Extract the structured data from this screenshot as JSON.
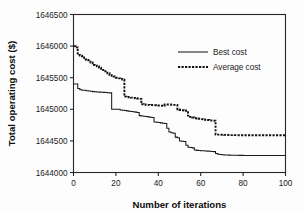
{
  "chart_data": {
    "type": "line",
    "title": "",
    "xlabel": "Number of iterations",
    "ylabel": "Total operating cost ($)",
    "xlim": [
      0,
      100
    ],
    "ylim": [
      1644000,
      1646500
    ],
    "xticks": [
      0,
      20,
      40,
      60,
      80,
      100
    ],
    "yticks": [
      1644000,
      1644500,
      1645000,
      1645500,
      1646000,
      1646500
    ],
    "xtick_labels": [
      "0",
      "20",
      "40",
      "60",
      "80",
      "100"
    ],
    "ytick_labels": [
      "1644000",
      "1644500",
      "1645000",
      "1645500",
      "1646000",
      "1646500"
    ],
    "grid": false,
    "legend_position": "upper right",
    "series": [
      {
        "name": "Best cost",
        "style": "solid",
        "x": [
          0,
          1,
          2,
          3,
          4,
          5,
          6,
          7,
          8,
          9,
          10,
          11,
          12,
          13,
          14,
          15,
          16,
          17,
          18,
          19,
          20,
          21,
          22,
          23,
          24,
          25,
          26,
          27,
          28,
          29,
          30,
          31,
          32,
          33,
          34,
          35,
          36,
          37,
          38,
          39,
          40,
          41,
          42,
          43,
          44,
          45,
          46,
          47,
          48,
          49,
          50,
          51,
          52,
          53,
          54,
          55,
          56,
          57,
          58,
          59,
          60,
          61,
          62,
          63,
          64,
          65,
          66,
          67,
          68,
          69,
          70,
          71,
          72,
          73,
          74,
          75,
          76,
          77,
          78,
          79,
          80,
          81,
          82,
          83,
          84,
          85,
          86,
          87,
          88,
          89,
          90,
          91,
          92,
          93,
          94,
          95,
          96,
          97,
          98,
          99,
          100
        ],
        "y": [
          1645400,
          1645400,
          1645330,
          1645310,
          1645300,
          1645300,
          1645295,
          1645290,
          1645285,
          1645280,
          1645278,
          1645275,
          1645272,
          1645270,
          1645268,
          1645265,
          1645262,
          1645260,
          1645000,
          1645000,
          1645000,
          1645000,
          1644990,
          1644985,
          1644980,
          1644975,
          1644970,
          1644965,
          1644960,
          1644955,
          1644950,
          1644900,
          1644895,
          1644890,
          1644885,
          1644880,
          1644875,
          1644870,
          1644800,
          1644795,
          1644790,
          1644785,
          1644780,
          1644775,
          1644700,
          1644640,
          1644630,
          1644620,
          1644560,
          1644550,
          1644500,
          1644495,
          1644490,
          1644430,
          1644400,
          1644395,
          1644390,
          1644355,
          1644350,
          1644348,
          1644345,
          1644343,
          1644340,
          1644338,
          1644335,
          1644333,
          1644330,
          1644300,
          1644290,
          1644285,
          1644280,
          1644278,
          1644276,
          1644275,
          1644274,
          1644273,
          1644272,
          1644272,
          1644271,
          1644271,
          1644270,
          1644270,
          1644270,
          1644270,
          1644270,
          1644270,
          1644270,
          1644270,
          1644270,
          1644270,
          1644270,
          1644270,
          1644270,
          1644270,
          1644270,
          1644270,
          1644270,
          1644270,
          1644270,
          1644270,
          1644270
        ]
      },
      {
        "name": "Average cost",
        "style": "dashed",
        "x": [
          0,
          1,
          2,
          3,
          4,
          5,
          6,
          7,
          8,
          9,
          10,
          11,
          12,
          13,
          14,
          15,
          16,
          17,
          18,
          19,
          20,
          21,
          22,
          23,
          24,
          25,
          26,
          27,
          28,
          29,
          30,
          31,
          32,
          33,
          34,
          35,
          36,
          37,
          38,
          39,
          40,
          41,
          42,
          43,
          44,
          45,
          46,
          47,
          48,
          49,
          50,
          51,
          52,
          53,
          54,
          55,
          56,
          57,
          58,
          59,
          60,
          61,
          62,
          63,
          64,
          65,
          66,
          67,
          68,
          69,
          70,
          71,
          72,
          73,
          74,
          75,
          76,
          77,
          78,
          79,
          80,
          81,
          82,
          83,
          84,
          85,
          86,
          87,
          88,
          89,
          90,
          91,
          92,
          93,
          94,
          95,
          96,
          97,
          98,
          99,
          100
        ],
        "y": [
          1646000,
          1645980,
          1645860,
          1645850,
          1645840,
          1645790,
          1645780,
          1645775,
          1645740,
          1645700,
          1645690,
          1645680,
          1645660,
          1645640,
          1645620,
          1645600,
          1645570,
          1645540,
          1645530,
          1645520,
          1645500,
          1645490,
          1645480,
          1645470,
          1645200,
          1645195,
          1645190,
          1645185,
          1645180,
          1645175,
          1645170,
          1645165,
          1645080,
          1645075,
          1645072,
          1645070,
          1645068,
          1645066,
          1645064,
          1645062,
          1645060,
          1645058,
          1645056,
          1645075,
          1645075,
          1645075,
          1645072,
          1645070,
          1645070,
          1645000,
          1644990,
          1644985,
          1644980,
          1644975,
          1644900,
          1644880,
          1644870,
          1644860,
          1644855,
          1644850,
          1644845,
          1644840,
          1644835,
          1644830,
          1644825,
          1644822,
          1644820,
          1644600,
          1644600,
          1644598,
          1644596,
          1644595,
          1644594,
          1644593,
          1644592,
          1644592,
          1644591,
          1644591,
          1644590,
          1644590,
          1644590,
          1644590,
          1644590,
          1644590,
          1644590,
          1644590,
          1644590,
          1644590,
          1644590,
          1644590,
          1644590,
          1644590,
          1644590,
          1644590,
          1644590,
          1644590,
          1644590,
          1644590,
          1644590,
          1644590,
          1644590
        ]
      }
    ],
    "legend_entries": [
      {
        "label": "Best cost",
        "style": "solid"
      },
      {
        "label": "Average cost",
        "style": "dashed"
      }
    ]
  }
}
